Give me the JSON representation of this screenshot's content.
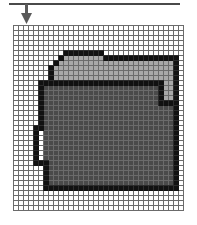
{
  "figure": {
    "background_color": "#ffffff",
    "width": 197,
    "height": 225
  },
  "callout": {
    "rule": {
      "name": "horizontal-rule",
      "color": "#4a4a4a",
      "x": 9,
      "y": 3,
      "width": 171,
      "height": 2
    },
    "arrow": {
      "name": "down-arrow",
      "color": "#5a5a5a",
      "direction": "down",
      "shaft_x": 26,
      "shaft_top": 4,
      "shaft_bottom": 14,
      "shaft_width": 3,
      "head_half_width": 5,
      "head_top": 13,
      "head_tip_y": 24
    }
  },
  "grid": {
    "origin_x": 13,
    "origin_y": 25,
    "cell_size": 5,
    "columns": 34,
    "rows": 37,
    "line_color": "#6b6b6b",
    "line_width": 1,
    "empty_cell_color": "#ffffff",
    "border_color": "#6b6b6b"
  },
  "palette": {
    "outline": "#111111",
    "folder_back": "#a8a8a8",
    "folder_front": "#4a4a4a",
    "empty": "#ffffff",
    "grid_line": "#6b6b6b",
    "rule": "#4a4a4a",
    "arrow": "#5a5a5a"
  },
  "legend": {
    "outline_label": "outline (black)",
    "back_label": "folder back (light gray)",
    "front_label": "folder front (dark gray)",
    "empty_label": "empty (white)"
  },
  "chart_data": {
    "type": "heatmap",
    "xlabel": "",
    "ylabel": "",
    "columns": 34,
    "rows": 37,
    "value_colors": {
      "0": "#ffffff",
      "1": "#111111",
      "2": "#a8a8a8",
      "3": "#4a4a4a"
    },
    "legend_entries": [
      "empty",
      "outline",
      "folder back",
      "folder front"
    ],
    "cells": [
      "0000000000000000000000000000000000",
      "0000000000000000000000000000000000",
      "0000000000000000000000000000000000",
      "0000000000000000000000000000000000",
      "0000000000000000000000000000000000",
      "0000000000111111110000000000000000",
      "0000000001222222221111111111111110",
      "0000000012222222222222222222222210",
      "0000000122222222222222222222222210",
      "0000000122222222222222222222222210",
      "0000000122222222222222222222222210",
      "0000011111111111111111111111112210",
      "0000013333333333333333333333312210",
      "0000013333333333333333333333312210",
      "0000013333333333333333333333312210",
      "0000013333333333333333333333311110",
      "0000013333333333333333333333333310",
      "0000013333333333333333333333333310",
      "0000013333333333333333333333333310",
      "0000013333333333333333333333333310",
      "0000113333333333333333333333333310",
      "0000103333333333333333333333333310",
      "0000103333333333333333333333333310",
      "0000103333333333333333333333333310",
      "0000103333333333333333333333333310",
      "0000103333333333333333333333333310",
      "0000103333333333333333333333333310",
      "0000111333333333333333333333333310",
      "0000001333333333333333333333333310",
      "0000001333333333333333333333333310",
      "0000001333333333333333333333333310",
      "0000001333333333333333333333333310",
      "0000001111111111111111111111111110",
      "0000000000000000000000000000000000",
      "0000000000000000000000000000000000",
      "0000000000000000000000000000000000",
      "0000000000000000000000000000000000"
    ]
  }
}
